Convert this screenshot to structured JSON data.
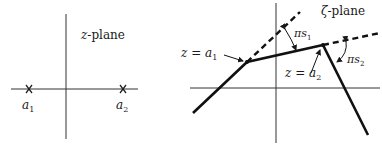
{
  "left_panel": {
    "title": "z-plane",
    "title_var": "z",
    "title_suffix": "-plane",
    "points": [
      {
        "name": "a",
        "sub": "1",
        "marker": "x-mark"
      },
      {
        "name": "a",
        "sub": "2",
        "marker": "x-mark"
      }
    ]
  },
  "right_panel": {
    "title_var": "ζ",
    "title_suffix": "-plane",
    "vertices": [
      {
        "label_var": "z",
        "label_eq": " = ",
        "label_name": "a",
        "label_sub": "1"
      },
      {
        "label_var": "z",
        "label_eq": " = ",
        "label_name": "a",
        "label_sub": "2"
      }
    ],
    "angles": [
      {
        "pi": "π",
        "s": "s",
        "sub": "1"
      },
      {
        "pi": "π",
        "s": "s",
        "sub": "2"
      }
    ]
  }
}
